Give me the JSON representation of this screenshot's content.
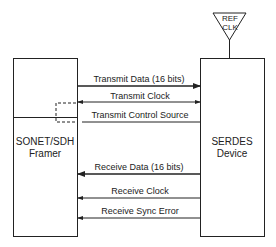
{
  "diagram": {
    "ref_clock": {
      "line1": "REF",
      "line2": "CLK"
    },
    "left_block": {
      "line1": "SONET/SDH",
      "line2": "Framer"
    },
    "right_block": {
      "line1": "SERDES",
      "line2": "Device"
    },
    "signals": [
      {
        "label": "Transmit Data (16 bits)",
        "direction": "left-to-right",
        "bus": true
      },
      {
        "label": "Transmit Clock",
        "direction": "bidirectional",
        "bus": false
      },
      {
        "label": "Transmit Control Source",
        "direction": "right-to-left",
        "bus": false
      },
      {
        "label": "Receive Data (16 bits)",
        "direction": "right-to-left",
        "bus": true
      },
      {
        "label": "Receive Clock",
        "direction": "right-to-left",
        "bus": false
      },
      {
        "label": "Receive Sync Error",
        "direction": "right-to-left",
        "bus": false
      }
    ],
    "colors": {
      "line": "#222222",
      "background": "#ffffff"
    }
  }
}
